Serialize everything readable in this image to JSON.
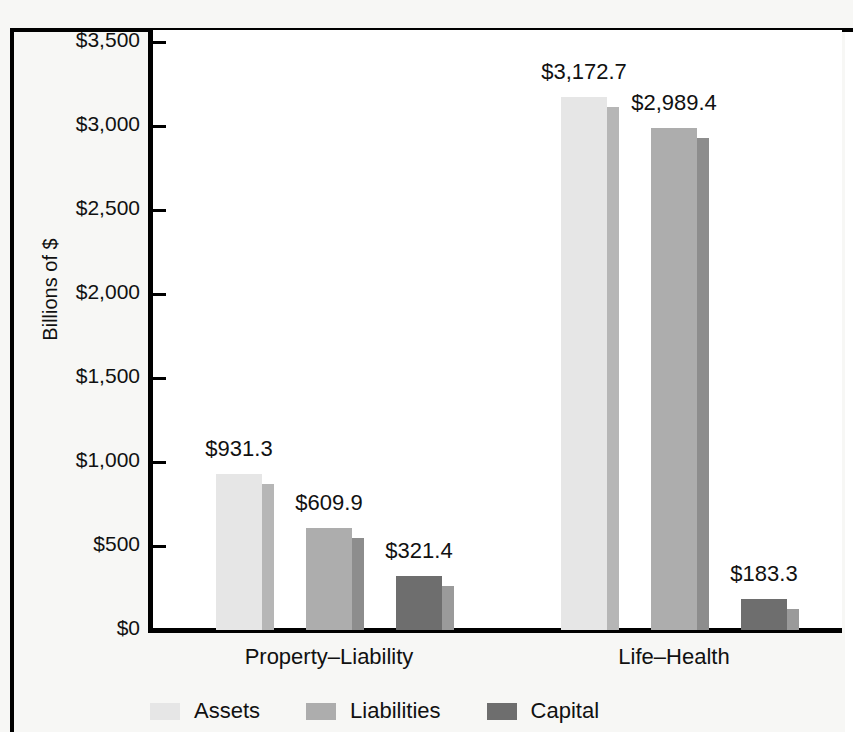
{
  "chart_data": {
    "type": "bar",
    "title": "",
    "subtitle": "",
    "xlabel": "",
    "ylabel": "Billions of $",
    "categories": [
      "Property–Liability",
      "Life–Health"
    ],
    "series": [
      {
        "name": "Assets",
        "color": "#e6e6e6",
        "shadow_color": "#b6b6b6",
        "values": [
          931.3,
          3172.7
        ],
        "labels": [
          "$931.3",
          "$3,172.7"
        ]
      },
      {
        "name": "Liabilities",
        "color": "#adadad",
        "shadow_color": "#8d8d8d",
        "values": [
          609.9,
          2989.4
        ],
        "labels": [
          "$609.9",
          "$2,989.4"
        ]
      },
      {
        "name": "Capital",
        "color": "#6e6e6e",
        "shadow_color": "#9a9a9a",
        "values": [
          321.4,
          183.3
        ],
        "labels": [
          "$321.4",
          "$183.3"
        ]
      }
    ],
    "ylim": [
      0,
      3500
    ],
    "ytick_values": [
      0,
      500,
      1000,
      1500,
      2000,
      2500,
      3000,
      3500
    ],
    "ytick_labels": [
      "$0",
      "$500",
      "$1,000",
      "$1,500",
      "$2,000",
      "$2,500",
      "$3,000",
      "$3,500"
    ],
    "grid": false,
    "legend_position": "bottom",
    "legend_entries": [
      "Assets",
      "Liabilities",
      "Capital"
    ]
  },
  "axis": {
    "y_title": "Billions of $",
    "ticks": [
      {
        "label": "$3,500"
      },
      {
        "label": "$3,000"
      },
      {
        "label": "$2,500"
      },
      {
        "label": "$2,000"
      },
      {
        "label": "$1,500"
      },
      {
        "label": "$1,000"
      },
      {
        "label": "$500"
      },
      {
        "label": "$0"
      }
    ]
  },
  "groups": [
    {
      "label": "Property–Liability",
      "bars": [
        {
          "series": "Assets",
          "value_label": "$931.3"
        },
        {
          "series": "Liabilities",
          "value_label": "$609.9"
        },
        {
          "series": "Capital",
          "value_label": "$321.4"
        }
      ]
    },
    {
      "label": "Life–Health",
      "bars": [
        {
          "series": "Assets",
          "value_label": "$3,172.7"
        },
        {
          "series": "Liabilities",
          "value_label": "$2,989.4"
        },
        {
          "series": "Capital",
          "value_label": "$183.3"
        }
      ]
    }
  ],
  "legend": {
    "items": [
      {
        "label": "Assets",
        "color": "#e6e6e6"
      },
      {
        "label": "Liabilities",
        "color": "#adadad"
      },
      {
        "label": "Capital",
        "color": "#6e6e6e"
      }
    ]
  }
}
